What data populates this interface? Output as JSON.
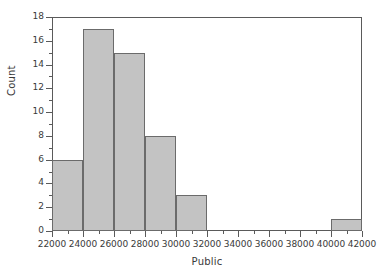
{
  "chart_data": {
    "type": "bar",
    "title": "",
    "xlabel": "Public",
    "ylabel": "Count",
    "xlim": [
      22000,
      42000
    ],
    "ylim": [
      0,
      18
    ],
    "grid": false,
    "legend": null,
    "bin_width": 2000,
    "xticks": [
      22000,
      24000,
      26000,
      28000,
      30000,
      32000,
      34000,
      36000,
      38000,
      40000,
      42000
    ],
    "xtick_labels": [
      "22000",
      "24000",
      "26000",
      "28000",
      "30000",
      "32000",
      "34000",
      "36000",
      "38000",
      "40000",
      "42000"
    ],
    "yticks": [
      0,
      2,
      4,
      6,
      8,
      10,
      12,
      14,
      16,
      18
    ],
    "ytick_labels": [
      "0",
      "2",
      "4",
      "6",
      "8",
      "10",
      "12",
      "14",
      "16",
      "18"
    ],
    "ytick_minor": [
      1,
      3,
      5,
      7,
      9,
      11,
      13,
      15,
      17
    ],
    "xtick_minor": [
      23000,
      25000,
      27000,
      29000,
      31000,
      33000,
      35000,
      37000,
      39000,
      41000
    ],
    "bins": [
      {
        "x0": 22000,
        "x1": 24000,
        "value": 6
      },
      {
        "x0": 24000,
        "x1": 26000,
        "value": 17
      },
      {
        "x0": 26000,
        "x1": 28000,
        "value": 15
      },
      {
        "x0": 28000,
        "x1": 30000,
        "value": 8
      },
      {
        "x0": 30000,
        "x1": 32000,
        "value": 3
      },
      {
        "x0": 32000,
        "x1": 34000,
        "value": 0
      },
      {
        "x0": 34000,
        "x1": 36000,
        "value": 0
      },
      {
        "x0": 36000,
        "x1": 38000,
        "value": 0
      },
      {
        "x0": 38000,
        "x1": 40000,
        "value": 0
      },
      {
        "x0": 40000,
        "x1": 42000,
        "value": 1
      }
    ],
    "categories": [
      "22000-24000",
      "24000-26000",
      "26000-28000",
      "28000-30000",
      "30000-32000",
      "32000-34000",
      "34000-36000",
      "36000-38000",
      "38000-40000",
      "40000-42000"
    ],
    "values": [
      6,
      17,
      15,
      8,
      3,
      0,
      0,
      0,
      0,
      1
    ],
    "colors": {
      "bar_fill": "#c3c3c3",
      "bar_edge": "#6b6b6b",
      "axis": "#5a5a5a",
      "text": "#3a3a3a",
      "background": "#ffffff"
    }
  }
}
